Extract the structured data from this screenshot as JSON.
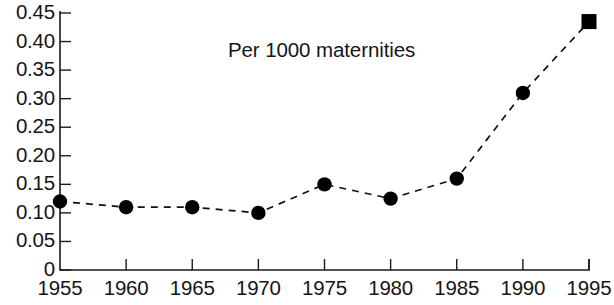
{
  "chart_data": {
    "type": "line",
    "title": "Per 1000 maternities",
    "xlabel": "",
    "ylabel": "",
    "x": [
      1955,
      1960,
      1965,
      1970,
      1975,
      1980,
      1985,
      1990,
      1995
    ],
    "values": [
      0.12,
      0.11,
      0.11,
      0.1,
      0.15,
      0.125,
      0.16,
      0.31,
      0.435
    ],
    "series": [
      {
        "name": "Per 1000 maternities",
        "values": [
          0.12,
          0.11,
          0.11,
          0.1,
          0.15,
          0.125,
          0.16,
          0.31,
          0.435
        ]
      }
    ],
    "x_tick_labels": [
      "1955",
      "1960",
      "1965",
      "1970",
      "1975",
      "1980",
      "1985",
      "1990",
      "1995"
    ],
    "y_tick_labels": [
      "0.45",
      "0.40",
      "0.35",
      "0.30",
      "0.25",
      "0.20",
      "0.15",
      "0.10",
      "0.05",
      "0"
    ],
    "y_tick_values": [
      0.45,
      0.4,
      0.35,
      0.3,
      0.25,
      0.2,
      0.15,
      0.1,
      0.05,
      0
    ],
    "xlim": [
      1955,
      1995
    ],
    "ylim": [
      0,
      0.45
    ],
    "grid": false,
    "legend": "none",
    "line_style": "dashed",
    "marker_style": [
      "circle",
      "circle",
      "circle",
      "circle",
      "circle",
      "circle",
      "circle",
      "circle",
      "square"
    ],
    "line_color": "#111111",
    "marker_color": "#000000",
    "axis_color": "#1a1a1a",
    "background_color": "#ffffff"
  }
}
